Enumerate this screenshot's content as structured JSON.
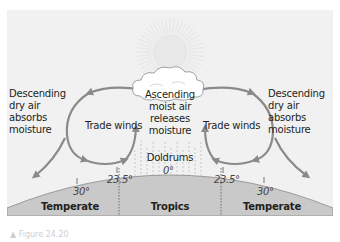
{
  "diagram": {
    "labels": {
      "left_descending": [
        "Descending",
        "dry air",
        "absorbs",
        "moisture"
      ],
      "right_descending": [
        "Descending",
        "dry air",
        "absorbs",
        "moisture"
      ],
      "ascending": [
        "Ascending",
        "moist air",
        "releases",
        "moisture"
      ],
      "trade_winds_left": "Trade winds",
      "trade_winds_right": "Trade winds",
      "doldrums": "Doldrums"
    },
    "latitudes": {
      "left_30": "30°",
      "left_23_5": "23.5°",
      "equator": "0°",
      "right_23_5": "23.5°",
      "right_30": "30°"
    },
    "zones": {
      "left_temperate": [
        "Temperate",
        "zone"
      ],
      "tropics": "Tropics",
      "right_temperate": [
        "Temperate",
        "zone"
      ]
    },
    "colors": {
      "background": "#f1f1f1",
      "earth": "#c9c9c9",
      "arrow": "#8a8a8a",
      "text": "#231f20"
    },
    "caption": "▲ Figure 24.20"
  }
}
